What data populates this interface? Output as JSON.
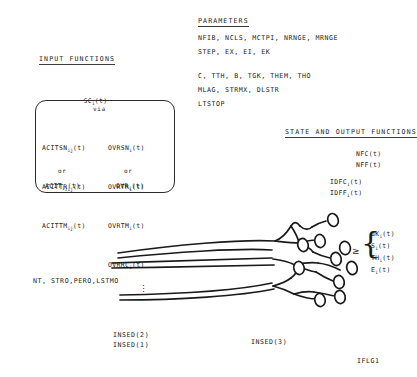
{
  "diagram": {
    "title_input_functions": "INPUT FUNCTIONS",
    "title_parameters": "PARAMETERS",
    "title_state_output": "STATE AND OUTPUT FUNCTIONS"
  },
  "input_functions": {
    "top_function": "SC",
    "top_function_sub": "i",
    "top_function_arg": "(t)",
    "via_label": "via",
    "or_label_left": "or",
    "or_label_right": "or",
    "left_column": [
      {
        "name": "ACITSN",
        "sub": "ij",
        "arg": "(t)"
      },
      {
        "name": "ACITTR",
        "sub": "ij",
        "arg": "(t)"
      },
      {
        "name": "ACITTM",
        "sub": "ij",
        "arg": "(t)"
      }
    ],
    "right_column": [
      {
        "name": "OVRSN",
        "sub": "i",
        "arg": "(t)"
      },
      {
        "name": "OVRTR",
        "sub": "i",
        "arg": "(t)"
      },
      {
        "name": "OVRTM",
        "sub": "i",
        "arg": "(t)"
      },
      {
        "name": "OVRRC",
        "sub": "i",
        "arg": "(t)"
      }
    ],
    "left_alt": {
      "name": "ACIT",
      "sub": "ij",
      "arg": "(t)"
    },
    "right_alt": {
      "name": "OVR",
      "sub": "i",
      "arg": "(t)"
    }
  },
  "parameters": {
    "lines": [
      "NFIB, NCLS, MCTPI, NRNGE, MRNGE",
      "STEP, EX, EI, EK",
      "C, TTH, B, TGK, THEM, THO",
      "MLAG, STRMX, DLSTR",
      "LTSTOP"
    ]
  },
  "state_output": {
    "global": [
      "NFC(t)",
      "NFF(t)"
    ],
    "indexed": [
      {
        "name": "IDFC",
        "sub": "i",
        "arg": "(t)"
      },
      {
        "name": "IDFF",
        "sub": "i",
        "arg": "(t)"
      }
    ],
    "relation_symbol": "≥",
    "braced": [
      {
        "name": "GK",
        "sub": "i",
        "arg": "(t)"
      },
      {
        "name": "S",
        "sub": "i",
        "arg": "(t)"
      },
      {
        "name": "TH",
        "sub": "i",
        "arg": "(t)"
      },
      {
        "name": "E",
        "sub": "i",
        "arg": "(t)"
      }
    ]
  },
  "annotations": {
    "fiber_params": "NT, STRO,PERO,LSTMO",
    "vertical_dots": "⋮",
    "inseed_2": "INSED(2)",
    "inseed_1": "INSED(1)",
    "inseed_3": "INSED(3)",
    "iflg1": "IFLG1"
  }
}
